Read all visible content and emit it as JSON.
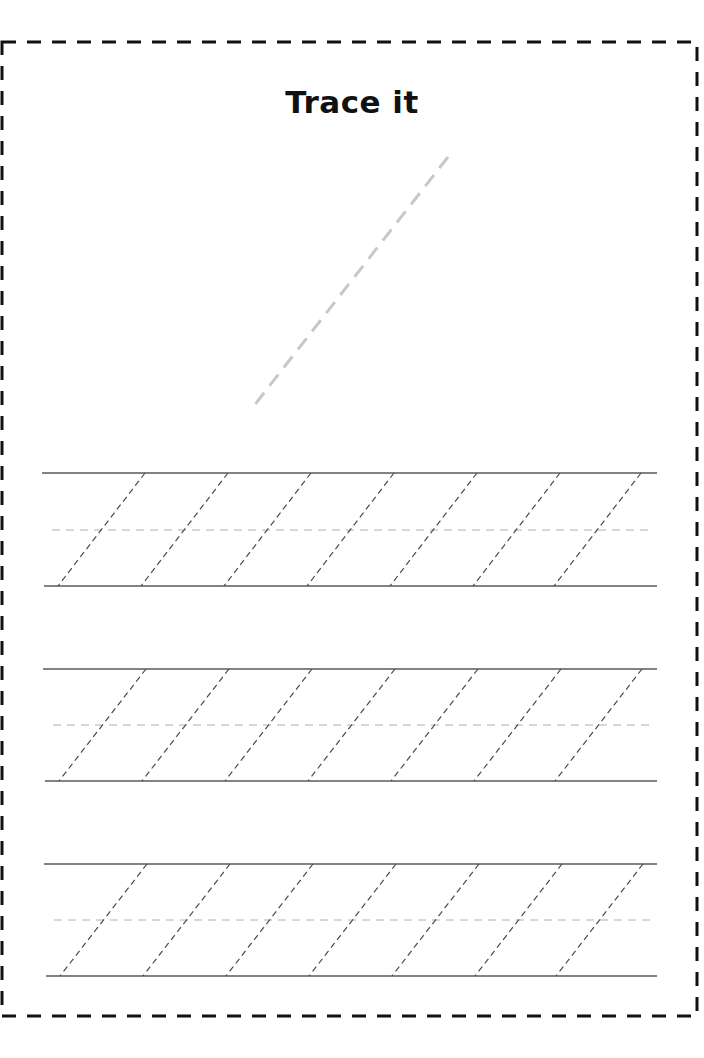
{
  "worksheet": {
    "title": "Trace it",
    "border": {
      "x1": 2,
      "y1": 42,
      "x2": 697,
      "y2": 1016,
      "color": "#111111",
      "dash": "14 11",
      "width": 3
    },
    "example_stroke": {
      "x1": 448,
      "y1": 157,
      "x2": 253,
      "y2": 407,
      "color": "#c8c8c8",
      "dash": "14 9",
      "width": 3
    },
    "practice_rows": [
      {
        "top_y": 473,
        "mid_y": 530,
        "bottom_y": 586,
        "line_x1": 42,
        "line_x2": 657,
        "diag_top_x": [
          145,
          228,
          311,
          394,
          477,
          560,
          641
        ],
        "slant": 87
      },
      {
        "top_y": 669,
        "mid_y": 725,
        "bottom_y": 781,
        "line_x1": 43,
        "line_x2": 657,
        "diag_top_x": [
          146,
          229,
          312,
          395,
          478,
          561,
          642
        ],
        "slant": 87
      },
      {
        "top_y": 864,
        "mid_y": 920,
        "bottom_y": 976,
        "line_x1": 44,
        "line_x2": 657,
        "diag_top_x": [
          147,
          230,
          313,
          396,
          479,
          562,
          643
        ],
        "slant": 87
      }
    ],
    "colors": {
      "guide_line": "#5a5a5a",
      "mid_line": "#b0b0b0",
      "trace_diagonal": "#4a4a4a"
    }
  }
}
